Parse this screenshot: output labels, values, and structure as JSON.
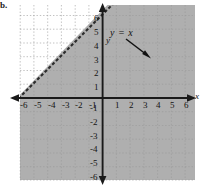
{
  "figure": {
    "problem_label": "b.",
    "annotation": "y = x",
    "background_color": "#ffffff",
    "shade_color": "#a8a8a8",
    "grid_color": "#b9b9b9",
    "axis_color": "#1a1a1a"
  },
  "axes": {
    "x_name": "x",
    "y_name": "y"
  },
  "chart_data": {
    "type": "line",
    "title": "",
    "subtitle": "",
    "xlabel": "x",
    "ylabel": "y",
    "xlim": [
      -6.5,
      6.5
    ],
    "ylim": [
      -6.5,
      6.5
    ],
    "grid": true,
    "legend_position": "none",
    "x_ticks": [
      -6,
      -5,
      -4,
      -3,
      -2,
      -1,
      1,
      2,
      3,
      4,
      5,
      6
    ],
    "y_ticks": [
      6,
      5,
      4,
      3,
      2,
      1,
      -1,
      -2,
      -3,
      -4,
      -5,
      -6
    ],
    "x_tick_labels": [
      "-6",
      "-5",
      "-4",
      "-3",
      "-2",
      "-1",
      "1",
      "2",
      "3",
      "4",
      "5",
      "6"
    ],
    "y_tick_labels": [
      "6",
      "5",
      "4",
      "3",
      "2",
      "1",
      "-1",
      "-2",
      "-3",
      "-4",
      "-5",
      "-6"
    ],
    "series": [
      {
        "name": "y = x",
        "equation": "y = x",
        "slope": 1,
        "intercept": 0,
        "line_style": "dashed",
        "x": [
          -6.5,
          6.5
        ],
        "values": [
          -6.5,
          6.5
        ]
      }
    ],
    "shaded_region": {
      "inequality": "y < x",
      "side": "below-right",
      "boundary_included": false,
      "color": "#a8a8a8"
    },
    "annotations": [
      {
        "text": "y = x",
        "x": -0.2,
        "y": 4.6,
        "arrow_to_x": 3.4,
        "arrow_to_y": 3.0
      }
    ]
  },
  "x_tick_positions": [
    {
      "label": "-6",
      "left": 20,
      "top": 101
    },
    {
      "label": "-5",
      "left": 34,
      "top": 101
    },
    {
      "label": "-4",
      "left": 48,
      "top": 101
    },
    {
      "label": "-3",
      "left": 62,
      "top": 101
    },
    {
      "label": "-2",
      "left": 75,
      "top": 101
    },
    {
      "label": "-1",
      "left": 89,
      "top": 101
    },
    {
      "label": "1",
      "left": 115,
      "top": 101
    },
    {
      "label": "2",
      "left": 129,
      "top": 101
    },
    {
      "label": "3",
      "left": 143,
      "top": 101
    },
    {
      "label": "4",
      "left": 156,
      "top": 101
    },
    {
      "label": "5",
      "left": 170,
      "top": 101
    },
    {
      "label": "6",
      "left": 184,
      "top": 101
    }
  ],
  "y_tick_positions": [
    {
      "label": "6",
      "left": 94,
      "top": 14
    },
    {
      "label": "5",
      "left": 94,
      "top": 28
    },
    {
      "label": "4",
      "left": 94,
      "top": 42
    },
    {
      "label": "3",
      "left": 94,
      "top": 56
    },
    {
      "label": "2",
      "left": 94,
      "top": 69
    },
    {
      "label": "1",
      "left": 94,
      "top": 83
    },
    {
      "label": "-1",
      "left": 90,
      "top": 104
    },
    {
      "label": "-2",
      "left": 90,
      "top": 118
    },
    {
      "label": "-3",
      "left": 90,
      "top": 132
    },
    {
      "label": "-4",
      "left": 90,
      "top": 145
    },
    {
      "label": "-5",
      "left": 90,
      "top": 159
    },
    {
      "label": "-6",
      "left": 90,
      "top": 173
    }
  ]
}
